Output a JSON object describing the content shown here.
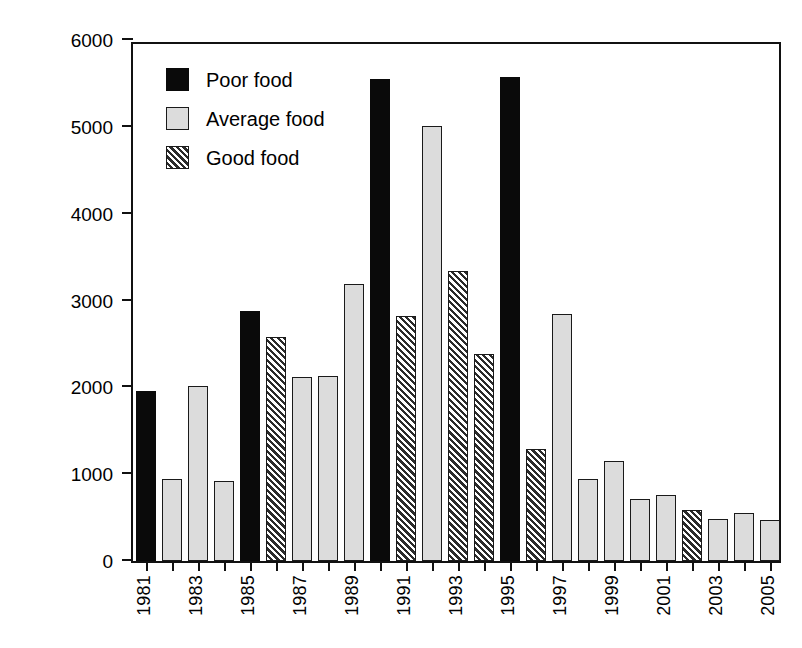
{
  "chart_data": {
    "type": "bar",
    "title": "",
    "subtitle": "",
    "xlabel": "",
    "ylabel": "Nuisance complaints",
    "ylim": [
      0,
      6000
    ],
    "yticks": [
      0,
      1000,
      2000,
      3000,
      4000,
      5000,
      6000
    ],
    "ytick_labels": [
      "0",
      "1000",
      "2000",
      "3000",
      "4000",
      "5000",
      "6000"
    ],
    "grid": false,
    "legend_position": "upper left",
    "categories": [
      "1981",
      "1982",
      "1983",
      "1984",
      "1985",
      "1986",
      "1987",
      "1988",
      "1989",
      "1990",
      "1991",
      "1992",
      "1993",
      "1994",
      "1995",
      "1996",
      "1997",
      "1998",
      "1999",
      "2000",
      "2001",
      "2002",
      "2003",
      "2004",
      "2005"
    ],
    "xtick_labels": [
      "1981",
      "1983",
      "1985",
      "1987",
      "1989",
      "1991",
      "1993",
      "1995",
      "1997",
      "1999",
      "2001",
      "2003",
      "2005"
    ],
    "values": [
      1960,
      940,
      2010,
      920,
      2880,
      2580,
      2120,
      2130,
      3190,
      5550,
      2820,
      5010,
      3340,
      2380,
      5570,
      1290,
      2840,
      950,
      1150,
      710,
      760,
      590,
      480,
      550,
      470
    ],
    "bar_styles": [
      "poor",
      "average",
      "average",
      "average",
      "poor",
      "good",
      "average",
      "average",
      "average",
      "poor",
      "good",
      "average",
      "good",
      "good",
      "poor",
      "good",
      "average",
      "average",
      "average",
      "average",
      "average",
      "good",
      "average",
      "average",
      "average"
    ],
    "legend": [
      {
        "label": "Poor food",
        "style": "poor",
        "color": "#0a0a0a"
      },
      {
        "label": "Average food",
        "style": "average",
        "color": "#dcdcdc"
      },
      {
        "label": "Good food",
        "style": "good",
        "color": "#2b2b2b"
      }
    ]
  }
}
